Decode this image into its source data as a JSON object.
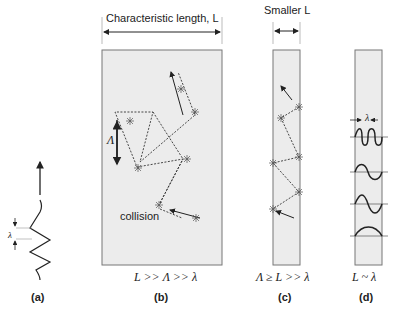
{
  "top_labels": {
    "characteristic_length": "Characteristic length, L",
    "smaller_L": "Smaller L"
  },
  "panel_b": {
    "lambda_label": "Λ",
    "collision_label": "collision",
    "relation": "L >> Λ >> λ",
    "tag": "(b)"
  },
  "panel_a": {
    "lambda_label": "λ",
    "tag": "(a)"
  },
  "panel_c": {
    "relation": "Λ ≥ L >> λ",
    "tag": "(c)"
  },
  "panel_d": {
    "lambda_label": "λ",
    "relation": "L ~ λ",
    "tag": "(d)"
  },
  "colors": {
    "box_fill": "#ececec",
    "box_stroke": "#777777",
    "line": "#333333"
  }
}
